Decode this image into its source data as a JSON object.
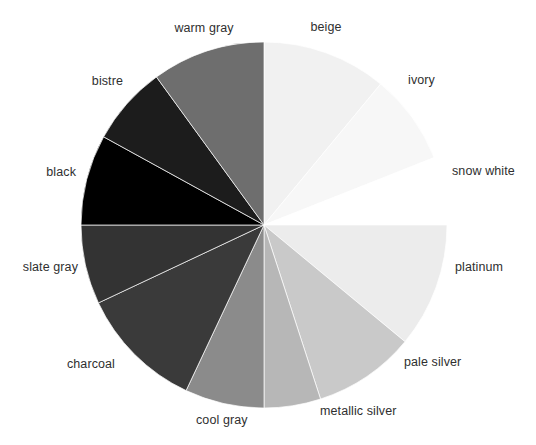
{
  "chart_data": {
    "type": "pie",
    "title": "",
    "xlabel": "",
    "ylabel": "",
    "legend_position": "none",
    "grid": false,
    "label_placement": "outside",
    "start_angle_deg": 0,
    "direction": "clockwise",
    "center_x": 264,
    "center_y": 225,
    "radius": 183,
    "categories": [
      "beige",
      "ivory",
      "snow white",
      "platinum",
      "pale silver",
      "metallic silver",
      "cool gray",
      "charcoal",
      "slate gray",
      "black",
      "bistre",
      "warm gray"
    ],
    "values": [
      11,
      8,
      6,
      11,
      9,
      10,
      5,
      17,
      3,
      8,
      7,
      5
    ],
    "colors": [
      "#f1f1f1",
      "#f7f7f7",
      "#ffffff",
      "#ececec",
      "#c9c9c9",
      "#b7b7b7",
      "#8b8b8b",
      "#3a3a3a",
      "#333333",
      "#000000",
      "#1c1c1c",
      "#6e6e6e"
    ],
    "slices": [
      {
        "label": "beige",
        "value": 11,
        "color": "#f1f1f1",
        "start_deg": 0,
        "end_deg": 39.6,
        "label_x": 326,
        "label_y": 28,
        "anchor": "mid"
      },
      {
        "label": "ivory",
        "value": 8,
        "color": "#f7f7f7",
        "start_deg": 39.6,
        "end_deg": 68.4,
        "label_x": 408,
        "label_y": 81,
        "anchor": "start"
      },
      {
        "label": "snow white",
        "value": 6,
        "color": "#ffffff",
        "start_deg": 68.4,
        "end_deg": 90.0,
        "label_x": 452,
        "label_y": 172,
        "anchor": "start"
      },
      {
        "label": "platinum",
        "value": 11,
        "color": "#ecece c",
        "start_deg": 90.0,
        "end_deg": 129.6,
        "label_x": 455,
        "label_y": 268,
        "anchor": "start"
      },
      {
        "label": "pale silver",
        "value": 9,
        "color": "#c9c9c9",
        "start_deg": 129.6,
        "end_deg": 162.0,
        "label_x": 404,
        "label_y": 363,
        "anchor": "start"
      },
      {
        "label": "metallic silver",
        "value": 10,
        "color": "#b7b7b7",
        "start_deg": 162.0,
        "end_deg": 180.0,
        "label_x": 320,
        "label_y": 412,
        "anchor": "start"
      },
      {
        "label": "cool gray",
        "value": 5,
        "color": "#8b8b8b",
        "start_deg": 180.0,
        "end_deg": 205.2,
        "label_x": 196,
        "label_y": 421,
        "anchor": "start"
      },
      {
        "label": "charcoal",
        "value": 17,
        "color": "#3a3a3a",
        "start_deg": 205.2,
        "end_deg": 244.8,
        "label_x": 115,
        "label_y": 365,
        "anchor": "end"
      },
      {
        "label": "slate gray",
        "value": 3,
        "color": "#333333",
        "start_deg": 244.8,
        "end_deg": 270.0,
        "label_x": 78,
        "label_y": 268,
        "anchor": "end"
      },
      {
        "label": "black",
        "value": 8,
        "color": "#000000",
        "start_deg": 270.0,
        "end_deg": 298.8,
        "label_x": 76,
        "label_y": 173,
        "anchor": "end"
      },
      {
        "label": "bistre",
        "value": 7,
        "color": "#1c1c1c",
        "start_deg": 298.8,
        "end_deg": 324.0,
        "label_x": 123,
        "label_y": 82,
        "anchor": "end"
      },
      {
        "label": "warm gray",
        "value": 5,
        "color": "#6e6e6e",
        "start_deg": 324.0,
        "end_deg": 360.0,
        "label_x": 204,
        "label_y": 29,
        "anchor": "mid"
      }
    ]
  }
}
